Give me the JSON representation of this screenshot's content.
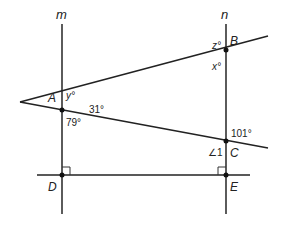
{
  "lines": {
    "m": {
      "label": "m"
    },
    "n": {
      "label": "n"
    }
  },
  "points": {
    "A": "A",
    "B": "B",
    "C": "C",
    "D": "D",
    "E": "E"
  },
  "angles": {
    "y": "y°",
    "a31": "31°",
    "a79": "79°",
    "z": "z°",
    "x": "x°",
    "a101": "101°",
    "angle1": "∠1"
  },
  "colors": {
    "line": "#222222",
    "background": "#ffffff"
  }
}
